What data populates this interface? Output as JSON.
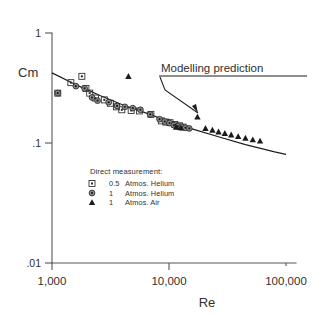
{
  "chart_data": {
    "type": "scatter",
    "title": "",
    "xlabel": "Re",
    "ylabel": "Cm",
    "xscale": "log",
    "yscale": "log",
    "xlim": [
      1000,
      100000
    ],
    "ylim": [
      0.01,
      1
    ],
    "grid": false,
    "x_ticks": [
      {
        "value": 1000,
        "label": "1,000"
      },
      {
        "value": 10000,
        "label": "10,000"
      },
      {
        "value": 100000,
        "label": "100,000"
      }
    ],
    "y_ticks": [
      {
        "value": 1,
        "label": "1"
      },
      {
        "value": 0.1,
        "label": ".1"
      },
      {
        "value": 0.01,
        "label": ".01"
      }
    ],
    "legend_position": "inside-lower-left",
    "legend_title": "Direct measurement:",
    "annotations": [
      {
        "text": "Modelling prediction",
        "target_x": 9500,
        "target_y": 0.172,
        "underlined": true
      }
    ],
    "series": [
      {
        "name": "0.5 Atmos. Helium",
        "marker": "square",
        "points": [
          [
            1120,
            0.3
          ],
          [
            1450,
            0.37
          ],
          [
            1800,
            0.42
          ],
          [
            1950,
            0.33
          ],
          [
            2100,
            0.3
          ],
          [
            2350,
            0.272
          ],
          [
            2800,
            0.262
          ],
          [
            3150,
            0.245
          ],
          [
            3550,
            0.228
          ],
          [
            3950,
            0.215
          ],
          [
            4750,
            0.212
          ],
          [
            5600,
            0.21
          ],
          [
            7000,
            0.196
          ],
          [
            8600,
            0.172
          ],
          [
            9400,
            0.168
          ],
          [
            10200,
            0.166
          ],
          [
            11200,
            0.16
          ],
          [
            12300,
            0.156
          ],
          [
            13200,
            0.152
          ]
        ]
      },
      {
        "name": "1 Atmos. Helium",
        "marker": "circle",
        "points": [
          [
            1120,
            0.3
          ],
          [
            1600,
            0.345
          ],
          [
            1900,
            0.33
          ],
          [
            2200,
            0.275
          ],
          [
            2450,
            0.258
          ],
          [
            3050,
            0.25
          ],
          [
            3600,
            0.232
          ],
          [
            4200,
            0.228
          ],
          [
            4900,
            0.222
          ],
          [
            5700,
            0.215
          ],
          [
            6900,
            0.196
          ],
          [
            8300,
            0.178
          ],
          [
            9200,
            0.17
          ],
          [
            10100,
            0.165
          ],
          [
            11000,
            0.158
          ],
          [
            11900,
            0.155
          ],
          [
            12800,
            0.153
          ],
          [
            13800,
            0.15
          ],
          [
            14900,
            0.148
          ]
        ]
      },
      {
        "name": "1 Atmos. Air",
        "marker": "triangle",
        "points": [
          [
            4500,
            0.42
          ],
          [
            11500,
            0.152
          ],
          [
            12600,
            0.15
          ],
          [
            17500,
            0.186
          ],
          [
            20500,
            0.148
          ],
          [
            23500,
            0.143
          ],
          [
            26500,
            0.138
          ],
          [
            30000,
            0.134
          ],
          [
            34000,
            0.13
          ],
          [
            39000,
            0.126
          ],
          [
            45000,
            0.122
          ],
          [
            52000,
            0.118
          ],
          [
            60000,
            0.115
          ]
        ]
      }
    ],
    "model_line": {
      "name": "Modelling prediction",
      "points": [
        [
          1000,
          0.45
        ],
        [
          1700,
          0.345
        ],
        [
          2600,
          0.285
        ],
        [
          4000,
          0.238
        ],
        [
          6500,
          0.2
        ],
        [
          10000,
          0.17
        ],
        [
          16000,
          0.146
        ],
        [
          26000,
          0.126
        ],
        [
          45000,
          0.107
        ],
        [
          80000,
          0.0925
        ],
        [
          100000,
          0.088
        ]
      ]
    },
    "legend_entries": [
      {
        "marker": "square",
        "qty": "0.5",
        "unit": "Atmos.",
        "gas": "Helium",
        "label": "0.5 Atmos. Helium"
      },
      {
        "marker": "circle",
        "qty": "1",
        "unit": "Atmos.",
        "gas": "Helium",
        "label": "1 Atmos. Helium"
      },
      {
        "marker": "triangle",
        "qty": "1",
        "unit": "Atmos.",
        "gas": "Air",
        "label": "1 Atmos. Air"
      }
    ],
    "colors": {
      "axis": "#55565a",
      "line": "#1d1d1d",
      "marker_square": "#2a2a2a",
      "marker_circle": "#8d8d8d",
      "marker_triangle": "#1b1b1b",
      "background": "#ffffff",
      "text": "#2f3033"
    }
  }
}
